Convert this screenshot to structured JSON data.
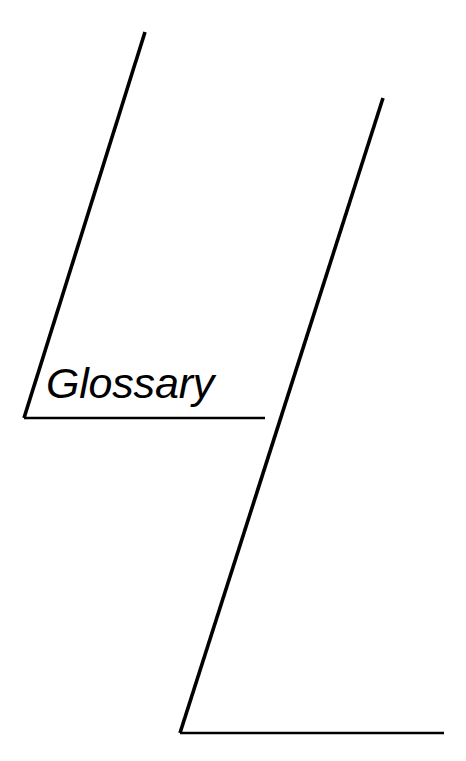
{
  "page": {
    "title": "Glossary",
    "width": 466,
    "height": 761,
    "background_color": "#ffffff",
    "ink_color": "#000000"
  },
  "section_divider": {
    "title": "Glossary",
    "title_style": "italic-sans-serif",
    "title_color": "#000000"
  },
  "artwork": {
    "description": "section-divider-rules",
    "stroke_color": "#000000",
    "upper_diagonal_rule": {
      "name": "upper-diagonal-rule",
      "x1": 145,
      "y1": 32,
      "x2": 24,
      "y2": 418,
      "stroke_width": 3.6
    },
    "title_underline_rule": {
      "name": "title-underline-rule",
      "x1": 24,
      "y1": 418,
      "x2": 265,
      "y2": 418,
      "stroke_width": 2.6
    },
    "lower_diagonal_rule": {
      "name": "lower-diagonal-rule",
      "x1": 383,
      "y1": 98,
      "x2": 180,
      "y2": 733,
      "stroke_width": 3.6
    },
    "bottom_rule": {
      "name": "bottom-rule",
      "x1": 180,
      "y1": 733,
      "x2": 444,
      "y2": 733,
      "stroke_width": 2.6
    }
  }
}
